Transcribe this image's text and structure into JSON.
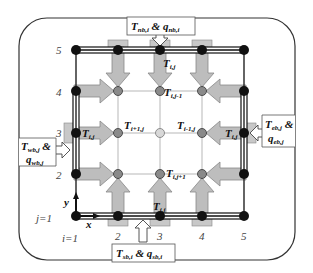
{
  "diagram": {
    "axes": {
      "x_label": "x",
      "y_label": "y"
    },
    "index_labels": {
      "j_start": "j=1",
      "i_start": "i=1"
    },
    "row_numbers": [
      "2",
      "3",
      "4",
      "5"
    ],
    "col_numbers": [
      "2",
      "3",
      "4",
      "5"
    ],
    "boundaries": {
      "north": {
        "T": "T",
        "T_sub": "nb,i",
        "amp": "&",
        "q": "q",
        "q_sub": "nb,i"
      },
      "south": {
        "T": "T",
        "T_sub": "sb,i",
        "amp": "&",
        "q": "q",
        "q_sub": "sb,i"
      },
      "west": {
        "T": "T",
        "T_sub": "wb,j",
        "amp": "&",
        "q": "q",
        "q_sub": "wb,j"
      },
      "east": {
        "T": "T",
        "T_sub": "eb,j",
        "amp": "&",
        "q": "q",
        "q_sub": "eb,j"
      }
    },
    "node_labels": {
      "top": {
        "T": "T",
        "sub": "i,j"
      },
      "top_inner": {
        "T": "T",
        "sub": "i,j-1"
      },
      "left": {
        "T": "T",
        "sub": "i,j"
      },
      "left_inner": {
        "T": "T",
        "sub": "i+1,j"
      },
      "right": {
        "T": "T",
        "sub": "i,j"
      },
      "right_inner": {
        "T": "T",
        "sub": "i-1,j"
      },
      "bottom": {
        "T": "T",
        "sub": "i,j"
      },
      "bottom_inner": {
        "T": "T",
        "sub": "i,j+1"
      }
    },
    "colors": {
      "boundary_node": "#111111",
      "interior_node": "#8a8a8a",
      "center_node": "#d8d8d8",
      "arrow_fill": "#bdbdbd",
      "frame": "#333333"
    }
  }
}
